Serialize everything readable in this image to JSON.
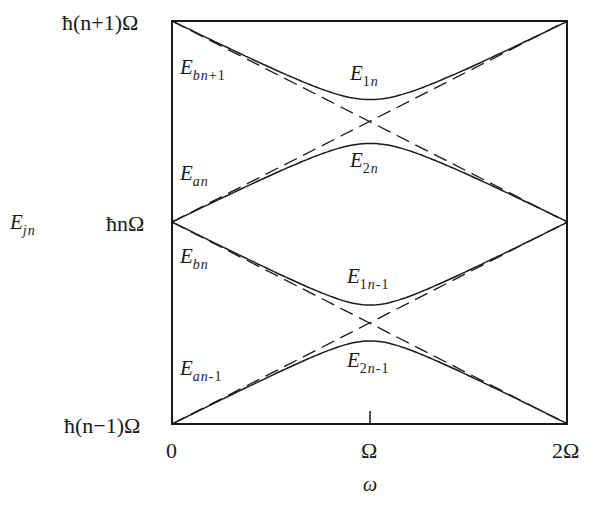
{
  "figure": {
    "y_axis_label": {
      "main": "E",
      "sub": "jn"
    },
    "x_axis_label": "ω",
    "y_ticks": [
      "ħ(n+1)Ω",
      "ħnΩ",
      "ħ(n−1)Ω"
    ],
    "x_ticks": [
      "0",
      "Ω",
      "2Ω"
    ],
    "curve_labels": [
      {
        "id": "Ebn+1",
        "main": "E",
        "sub_it": "bn",
        "sub_rest": "+1"
      },
      {
        "id": "E1n",
        "main": "E",
        "sub_num": "1",
        "sub_it": "n",
        "sub_rest": ""
      },
      {
        "id": "Ean",
        "main": "E",
        "sub_it": "an",
        "sub_rest": ""
      },
      {
        "id": "E2n",
        "main": "E",
        "sub_num": "2",
        "sub_it": "n",
        "sub_rest": ""
      },
      {
        "id": "Ebn",
        "main": "E",
        "sub_it": "bn",
        "sub_rest": ""
      },
      {
        "id": "E1n-1",
        "main": "E",
        "sub_num": "1",
        "sub_it": "n",
        "sub_rest": "-1"
      },
      {
        "id": "Ean-1",
        "main": "E",
        "sub_it": "an",
        "sub_rest": "-1"
      },
      {
        "id": "E2n-1",
        "main": "E",
        "sub_num": "2",
        "sub_it": "n",
        "sub_rest": "-1"
      }
    ],
    "colors": {
      "line": "#1a1a1a",
      "background": "#ffffff"
    }
  },
  "chart_data": {
    "type": "line",
    "title": "",
    "xlabel": "ω",
    "ylabel": "E_jn",
    "x_ticks": [
      "0",
      "Ω",
      "2Ω"
    ],
    "y_ticks": [
      "ħ(n−1)Ω",
      "ħnΩ",
      "ħ(n+1)Ω"
    ],
    "xlim": [
      0,
      2
    ],
    "ylim_units_hbarOmega": [
      -1,
      1
    ],
    "note": "x in units of Ω; y in units of ħΩ relative to ħnΩ",
    "series": [
      {
        "name": "E_bn+1 (dashed, uncoupled)",
        "style": "dashed",
        "x": [
          0,
          1,
          2
        ],
        "y": [
          1,
          0.5,
          0
        ]
      },
      {
        "name": "E_an (dashed, uncoupled)",
        "style": "dashed",
        "x": [
          0,
          1,
          2
        ],
        "y": [
          0,
          0.5,
          1
        ]
      },
      {
        "name": "E_bn (dashed, uncoupled)",
        "style": "dashed",
        "x": [
          0,
          1,
          2
        ],
        "y": [
          0,
          -0.5,
          -1
        ]
      },
      {
        "name": "E_an-1 (dashed, uncoupled)",
        "style": "dashed",
        "x": [
          0,
          1,
          2
        ],
        "y": [
          -1,
          -0.5,
          0
        ]
      },
      {
        "name": "E_1n (dressed)",
        "style": "solid",
        "x": [
          0,
          0.5,
          1,
          1.5,
          2
        ],
        "y": [
          1,
          0.76,
          0.61,
          0.76,
          1
        ]
      },
      {
        "name": "E_2n (dressed)",
        "style": "solid",
        "x": [
          0,
          0.5,
          1,
          1.5,
          2
        ],
        "y": [
          0,
          0.24,
          0.39,
          0.24,
          0
        ]
      },
      {
        "name": "E_1n-1 (dressed)",
        "style": "solid",
        "x": [
          0,
          0.5,
          1,
          1.5,
          2
        ],
        "y": [
          0,
          -0.26,
          -0.41,
          -0.26,
          0
        ]
      },
      {
        "name": "E_2n-1 (dressed)",
        "style": "solid",
        "x": [
          0,
          0.5,
          1,
          1.5,
          2
        ],
        "y": [
          -1,
          -0.74,
          -0.58,
          -0.74,
          -1
        ]
      }
    ],
    "annotations": [
      "level crossings at ω = Ω",
      "avoided crossings of dressed states"
    ]
  },
  "geometry": {
    "frame": {
      "x0": 172,
      "y0": 21,
      "x1": 567,
      "y1": 424
    },
    "mid_y": 222,
    "omega_x": 370,
    "gap_upper": 22,
    "gap_lower": 18
  }
}
